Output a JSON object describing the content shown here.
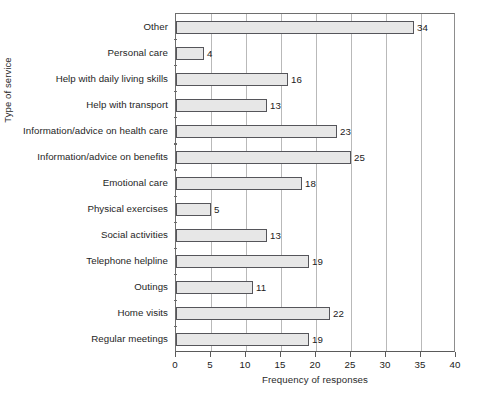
{
  "chart_data": {
    "type": "bar",
    "orientation": "horizontal",
    "title": "",
    "xlabel": "Frequency of responses",
    "ylabel": "Type of service",
    "xlim": [
      0,
      40
    ],
    "xticks": [
      0,
      5,
      10,
      15,
      20,
      25,
      30,
      35,
      40
    ],
    "grid": "vertical",
    "legend": "none",
    "bar_fill_color": "#e7e7e7",
    "bar_border_color": "#55555a",
    "categories": [
      "Other",
      "Personal care",
      "Help with daily living skills",
      "Help with transport",
      "Information/advice on health care",
      "Information/advice on benefits",
      "Emotional care",
      "Physical exercises",
      "Social activities",
      "Telephone helpline",
      "Outings",
      "Home visits",
      "Regular meetings"
    ],
    "values": [
      34,
      4,
      16,
      13,
      23,
      25,
      18,
      5,
      13,
      19,
      11,
      22,
      19
    ],
    "data_labels": [
      "34",
      "4",
      "16",
      "13",
      "23",
      "25",
      "18",
      "5",
      "13",
      "19",
      "11",
      "22",
      "19"
    ],
    "xtick_labels": [
      "0",
      "5",
      "10",
      "15",
      "20",
      "25",
      "30",
      "35",
      "40"
    ]
  }
}
